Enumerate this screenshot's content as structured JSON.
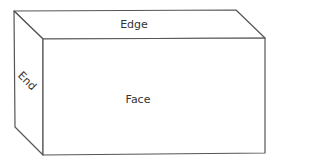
{
  "diagram": {
    "type": "3d-box",
    "stroke_color": "#555555",
    "labels": {
      "edge": "Edge",
      "end": "End",
      "face": "Face"
    },
    "vertices": {
      "back_top_left": [
        14,
        11
      ],
      "back_top_right": [
        236,
        10
      ],
      "back_bottom_left": [
        15,
        127
      ],
      "front_top_left": [
        43,
        39
      ],
      "front_top_right": [
        265,
        38
      ],
      "front_bottom_left": [
        43,
        155
      ],
      "front_bottom_right": [
        265,
        153
      ]
    }
  }
}
